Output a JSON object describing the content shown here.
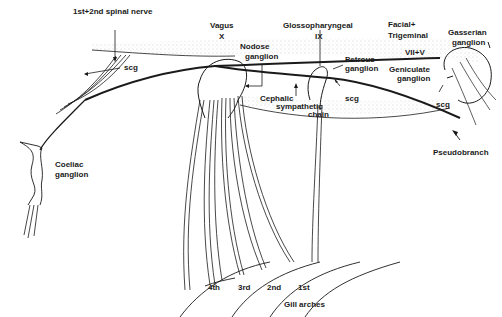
{
  "diagram": {
    "labels": {
      "spinal_nerve": "1st+2nd spinal nerve",
      "vagus": "Vagus",
      "vagus_numeral": "X",
      "glossopharyngeal": "Glossopharyngeal",
      "glossopharyngeal_numeral": "IX",
      "facial_trigeminal_line1": "Facial+",
      "facial_trigeminal_line2": "Trigeminal",
      "facial_trigeminal_numeral": "VII+V",
      "gasserian_line1": "Gasserian",
      "gasserian_line2": "ganglion",
      "nodose_line1": "Nodose",
      "nodose_line2": "ganglion",
      "petrous_line1": "Petrous",
      "petrous_line2": "ganglion",
      "geniculate_line1": "Geniculate",
      "geniculate_line2": "ganglion",
      "cephalic_line1": "Cephalic",
      "cephalic_line2": "sympathetic",
      "cephalic_line3": "chain",
      "scg_left": "scg",
      "scg_middle": "scg",
      "scg_right": "scg",
      "pseudobranch": "Pseudobranch",
      "coeliac_line1": "Coeliac",
      "coeliac_line2": "ganglion",
      "gill_arches": [
        "4th",
        "3rd",
        "2nd",
        "1st"
      ],
      "gill_arches_caption": "Gill arches"
    },
    "colors": {
      "ink": "#1a1a1a",
      "stipple": "#b8b8b8",
      "background": "#ffffff"
    }
  }
}
